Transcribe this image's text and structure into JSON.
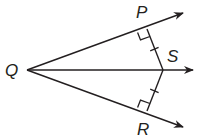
{
  "diagram": {
    "type": "geometry-angle-bisector",
    "colors": {
      "stroke": "#231f20",
      "background": "#ffffff"
    },
    "points": {
      "Q": {
        "label": "Q",
        "x": 27,
        "y": 70
      },
      "P": {
        "label": "P",
        "x": 147,
        "y": 29
      },
      "S": {
        "label": "S",
        "x": 163,
        "y": 70
      },
      "R": {
        "label": "R",
        "x": 147,
        "y": 111
      }
    },
    "rays": [
      {
        "name": "ray-QP",
        "from": "Q",
        "through": "P",
        "arrow": true
      },
      {
        "name": "ray-QS",
        "from": "Q",
        "through": "S",
        "arrow": true
      },
      {
        "name": "ray-QR",
        "from": "Q",
        "through": "R",
        "arrow": true
      }
    ],
    "segments": [
      {
        "name": "segment-PS",
        "from": "P",
        "to": "S",
        "tick_marks": 1
      },
      {
        "name": "segment-RS",
        "from": "R",
        "to": "S",
        "tick_marks": 1
      }
    ],
    "right_angles": [
      "P",
      "R"
    ],
    "labels": {
      "P": "P",
      "Q": "Q",
      "R": "R",
      "S": "S"
    }
  }
}
